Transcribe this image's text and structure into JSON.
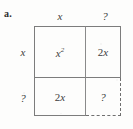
{
  "problem": {
    "label": "a."
  },
  "diagram": {
    "kind": "area-model-2x2",
    "line_color": "#7c7c7c",
    "dashed_line_color": "#6f6f6f",
    "text_color": "#3d3d3d",
    "background": "#fdfdfc",
    "column_headers": [
      "x",
      "?"
    ],
    "row_headers": [
      "x",
      "?"
    ],
    "cells": {
      "top_left": "x",
      "top_left_exponent": "2",
      "top_right_coefficient": "2",
      "top_right_variable": "x",
      "bottom_left_coefficient": "2",
      "bottom_left_variable": "x",
      "bottom_right": "?"
    }
  }
}
